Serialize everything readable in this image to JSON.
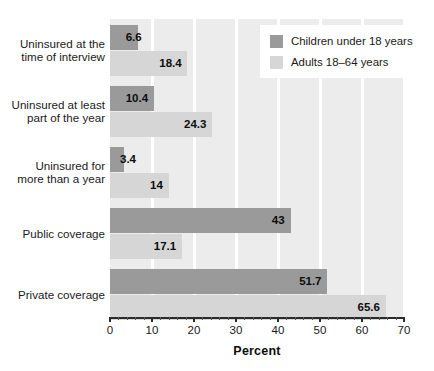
{
  "chart_data": {
    "type": "bar",
    "orientation": "horizontal",
    "title": "",
    "xlabel": "Percent",
    "ylabel": "",
    "xlim": [
      0,
      70
    ],
    "xticks": [
      0,
      10,
      20,
      30,
      40,
      50,
      60,
      70
    ],
    "xtick_labels": [
      "0",
      "10",
      "20",
      "30",
      "40",
      "50",
      "60",
      "70"
    ],
    "minor_tick_step": 2,
    "grid": "vertical-white-gridlines",
    "legend_position": "top-right",
    "categories": [
      "Uninsured at the time of interview",
      "Uninsured at least part of the year",
      "Uninsured for more than a year",
      "Public coverage",
      "Private coverage"
    ],
    "category_lines": [
      [
        "Uninsured at the",
        "time of interview"
      ],
      [
        "Uninsured at least",
        "part of the year"
      ],
      [
        "Uninsured for",
        "more than a year"
      ],
      [
        "Public coverage"
      ],
      [
        "Private coverage"
      ]
    ],
    "series": [
      {
        "name": "Children under 18 years",
        "color": "#9a9a9a",
        "values": [
          6.6,
          10.4,
          3.4,
          43,
          51.7
        ],
        "value_labels": [
          "6.6",
          "10.4",
          "3.4",
          "43",
          "51.7"
        ]
      },
      {
        "name": "Adults 18–64 years",
        "color": "#d6d6d6",
        "values": [
          18.4,
          24.3,
          14,
          17.1,
          65.6
        ],
        "value_labels": [
          "18.4",
          "24.3",
          "14",
          "17.1",
          "65.6"
        ]
      }
    ]
  },
  "legend": {
    "items": [
      {
        "label": "Children under 18 years",
        "swatch": "dark"
      },
      {
        "label": "Adults 18–64 years",
        "swatch": "light"
      }
    ]
  },
  "colors": {
    "series_children": "#9a9a9a",
    "series_adults": "#d6d6d6",
    "plot_background": "#ececec",
    "gridline": "#ffffff",
    "axis": "#2b2b2b",
    "text": "#1a1a1a"
  }
}
